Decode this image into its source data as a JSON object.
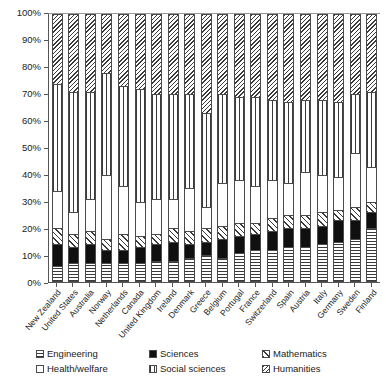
{
  "chart_data": {
    "type": "bar",
    "subtype": "stacked-percentage-column",
    "title": "",
    "xlabel": "",
    "ylabel": "",
    "ylim": [
      0,
      100
    ],
    "ytick_labels": [
      "100%",
      "90%",
      "80%",
      "70%",
      "60%",
      "50%",
      "40%",
      "30%",
      "20%",
      "10%",
      "0%"
    ],
    "ytick_values": [
      100,
      90,
      80,
      70,
      60,
      50,
      40,
      30,
      20,
      10,
      0
    ],
    "grid": false,
    "legend_position": "bottom",
    "stack_order_bottom_to_top": [
      "Engineering",
      "Sciences",
      "Mathematics",
      "Health/welfare",
      "Social sciences",
      "Humanities"
    ],
    "categories": [
      "New Zealand",
      "United States",
      "Australia",
      "Norway",
      "Netherlands",
      "Canada",
      "United Kingdom",
      "Ireland",
      "Denmark",
      "Greece",
      "Belgium",
      "Portugal",
      "France",
      "Switzerland",
      "Spain",
      "Austria",
      "Italy",
      "Germany",
      "Sweden",
      "Finland"
    ],
    "series": [
      {
        "name": "Engineering",
        "pattern": "horizontal-lines",
        "values": [
          6,
          7,
          7,
          7,
          7,
          7,
          8,
          8,
          9,
          10,
          9,
          11,
          12,
          12,
          13,
          13,
          14,
          15,
          16,
          20
        ]
      },
      {
        "name": "Sciences",
        "pattern": "solid-black",
        "values": [
          8,
          6,
          7,
          5,
          5,
          6,
          6,
          7,
          5,
          5,
          7,
          6,
          6,
          7,
          7,
          7,
          7,
          8,
          7,
          6
        ]
      },
      {
        "name": "Mathematics",
        "pattern": "diagonal-hatch-forward",
        "values": [
          6,
          5,
          5,
          4,
          6,
          4,
          4,
          5,
          5,
          5,
          5,
          5,
          4,
          5,
          5,
          5,
          5,
          4,
          5,
          4
        ]
      },
      {
        "name": "Health/welfare",
        "pattern": "white-empty",
        "values": [
          14,
          8,
          12,
          24,
          18,
          13,
          13,
          11,
          16,
          8,
          16,
          16,
          14,
          14,
          12,
          16,
          14,
          12,
          20,
          13
        ]
      },
      {
        "name": "Social sciences",
        "pattern": "vertical-lines",
        "values": [
          40,
          45,
          40,
          38,
          37,
          42,
          39,
          39,
          35,
          35,
          33,
          31,
          33,
          30,
          30,
          27,
          28,
          28,
          22,
          28
        ]
      },
      {
        "name": "Humanities",
        "pattern": "diagonal-hatch-back",
        "values": [
          26,
          29,
          29,
          22,
          27,
          28,
          30,
          30,
          30,
          37,
          30,
          31,
          31,
          32,
          33,
          32,
          32,
          33,
          30,
          29
        ]
      }
    ]
  },
  "legend": {
    "items": [
      {
        "label": "Engineering",
        "pattern_class": "p-eng"
      },
      {
        "label": "Sciences",
        "pattern_class": "p-sci"
      },
      {
        "label": "Mathematics",
        "pattern_class": "p-math"
      },
      {
        "label": "Health/welfare",
        "pattern_class": "p-health"
      },
      {
        "label": "Social sciences",
        "pattern_class": "p-social"
      },
      {
        "label": "Humanities",
        "pattern_class": "p-hum"
      }
    ],
    "display_order": [
      "Engineering",
      "Sciences",
      "Mathematics",
      "Health/welfare",
      "Social sciences",
      "Humanities"
    ]
  }
}
